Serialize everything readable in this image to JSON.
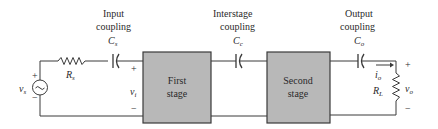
{
  "labels": {
    "input_coupling_line1": "Input",
    "input_coupling_line2": "coupling",
    "cs_main": "C",
    "cs_sub": "s",
    "interstage_line1": "Interstage",
    "interstage_line2": "coupling",
    "cc_main": "C",
    "cc_sub": "c",
    "output_coupling_line1": "Output",
    "output_coupling_line2": "coupling",
    "co_main": "C",
    "co_sub": "o",
    "rs_main": "R",
    "rs_sub": "s",
    "vs_main": "v",
    "vs_sub": "s",
    "vi_main": "v",
    "vi_sub": "i",
    "io_main": "i",
    "io_sub": "o",
    "rl_main": "R",
    "rl_sub": "L",
    "vo_main": "v",
    "vo_sub": "o",
    "plus": "+",
    "minus": "−"
  },
  "stages": {
    "first_line1": "First",
    "first_line2": "stage",
    "second_line1": "Second",
    "second_line2": "stage"
  },
  "colors": {
    "stage_fill": "#b8b8b8",
    "stage_border": "#3a3a3a",
    "wire": "#3a3a3a"
  }
}
